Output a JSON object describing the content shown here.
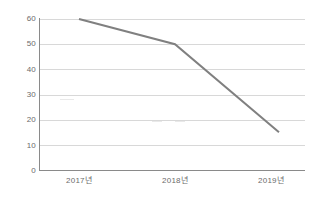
{
  "chart_data": {
    "type": "line",
    "title": "",
    "subtitle": "",
    "xlabel": "",
    "ylabel": "",
    "categories": [
      "2017년",
      "2018년",
      "2019년"
    ],
    "series": [
      {
        "name": "series-1",
        "values": [
          60,
          50,
          15
        ],
        "color": "#808080"
      }
    ],
    "ylim": [
      0,
      60
    ],
    "y_ticks": [
      "0",
      "10",
      "20",
      "30",
      "40",
      "50",
      "60"
    ],
    "y_tick_values": [
      0,
      10,
      20,
      30,
      40,
      50,
      60
    ],
    "grid": true,
    "grid_color": "#d8d8d8",
    "legend": "none",
    "axis_color": "#8a8a8a",
    "background": "#ffffff"
  },
  "axes": {
    "y_axis_name": "value-axis",
    "x_axis_name": "year-axis"
  }
}
